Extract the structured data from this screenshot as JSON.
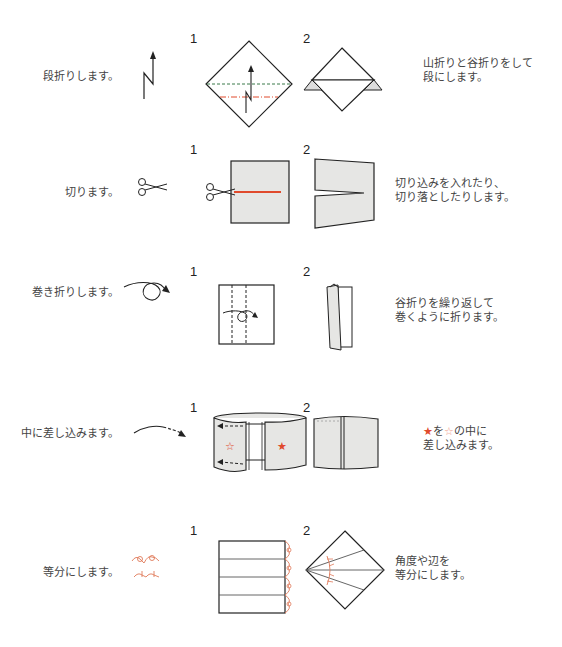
{
  "rows": [
    {
      "label": "段折りします。",
      "icon": "step-fold-arrow-icon",
      "step1": "1",
      "step2": "2",
      "description": [
        "山折りと谷折りをして",
        "段にします。"
      ]
    },
    {
      "label": "切ります。",
      "icon": "scissors-icon",
      "step1": "1",
      "step2": "2",
      "description": [
        "切り込みを入れたり、",
        "切り落としたりします。"
      ]
    },
    {
      "label": "巻き折りします。",
      "icon": "roll-fold-arrow-icon",
      "step1": "1",
      "step2": "2",
      "description": [
        "谷折りを繰り返して",
        "巻くように折ります。"
      ]
    },
    {
      "label": "中に差し込みます。",
      "icon": "insert-dashed-arrow-icon",
      "step1": "1",
      "step2": "2",
      "description_parts": {
        "filled_star": "★",
        "mid1": "を",
        "outline_star": "☆",
        "mid2": "の中に",
        "line2": "差し込みます。"
      }
    },
    {
      "label": "等分にします。",
      "icon": "equal-division-mark-icon",
      "step1": "1",
      "step2": "2",
      "description": [
        "角度や辺を",
        "等分にします。"
      ]
    }
  ],
  "colors": {
    "accent_red": "#e04a2c",
    "paper_gray": "#e6e6e4",
    "valley_green": "#3a7a4a",
    "line_black": "#222222"
  }
}
